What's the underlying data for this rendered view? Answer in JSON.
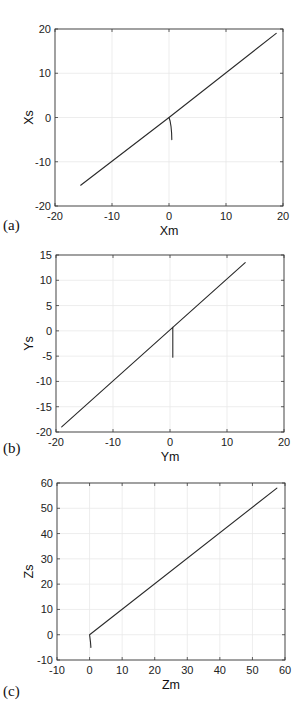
{
  "chart_data": [
    {
      "type": "line",
      "panel": "(a)",
      "title": "",
      "xlabel": "Xm",
      "ylabel": "Xs",
      "xlim": [
        -20,
        20
      ],
      "ylim": [
        -20,
        20
      ],
      "xticks": [
        -20,
        -10,
        0,
        10,
        20
      ],
      "yticks": [
        -20,
        -10,
        0,
        10,
        20
      ],
      "grid": true,
      "frame": {
        "left": 55,
        "top": 29,
        "right": 283,
        "bottom": 206
      },
      "series": [
        {
          "name": "trajectory",
          "x": [
            0.5,
            0.45,
            0.35,
            0.2,
            0.0,
            -15.5
          ],
          "y": [
            -5.0,
            -3.5,
            -2.0,
            -0.8,
            0.0,
            -15.3
          ]
        },
        {
          "name": "trajectory-main",
          "x": [
            0.0,
            18.8
          ],
          "y": [
            0.0,
            19.0
          ]
        }
      ]
    },
    {
      "type": "line",
      "panel": "(b)",
      "title": "",
      "xlabel": "Ym",
      "ylabel": "Ys",
      "xlim": [
        -20,
        20
      ],
      "ylim": [
        -20,
        15
      ],
      "xticks": [
        -20,
        -10,
        0,
        10,
        20
      ],
      "yticks": [
        -20,
        -15,
        -10,
        -5,
        0,
        5,
        10,
        15
      ],
      "grid": true,
      "frame": {
        "left": 56,
        "top": 255,
        "right": 284,
        "bottom": 432
      },
      "series": [
        {
          "name": "trajectory",
          "x": [
            0.5,
            0.5,
            0.5,
            -19.0
          ],
          "y": [
            -5.2,
            -2.0,
            0.7,
            -19.0
          ]
        },
        {
          "name": "trajectory-main",
          "x": [
            0.5,
            13.2
          ],
          "y": [
            0.7,
            13.5
          ]
        }
      ]
    },
    {
      "type": "line",
      "panel": "(c)",
      "title": "",
      "xlabel": "Zm",
      "ylabel": "Zs",
      "xlim": [
        -10,
        60
      ],
      "ylim": [
        -10,
        60
      ],
      "xticks": [
        -10,
        0,
        10,
        20,
        30,
        40,
        50,
        60
      ],
      "yticks": [
        -10,
        0,
        10,
        20,
        30,
        40,
        50,
        60
      ],
      "grid": true,
      "frame": {
        "left": 57,
        "top": 483,
        "right": 285,
        "bottom": 660
      },
      "series": [
        {
          "name": "trajectory",
          "x": [
            0.4,
            0.3,
            0.1,
            0.0,
            57.5
          ],
          "y": [
            -5.0,
            -3.0,
            -1.0,
            0.0,
            58.0
          ]
        }
      ]
    }
  ],
  "panels": {
    "a": {
      "label": "(a)",
      "xlabel": "Xm",
      "ylabel": "Xs",
      "xticks": [
        "-20",
        "-10",
        "0",
        "10",
        "20"
      ],
      "yticks": [
        "-20",
        "-10",
        "0",
        "10",
        "20"
      ]
    },
    "b": {
      "label": "(b)",
      "xlabel": "Ym",
      "ylabel": "Ys",
      "xticks": [
        "-20",
        "-10",
        "0",
        "10",
        "20"
      ],
      "yticks": [
        "-20",
        "-15",
        "-10",
        "-5",
        "0",
        "5",
        "10",
        "15"
      ]
    },
    "c": {
      "label": "(c)",
      "xlabel": "Zm",
      "ylabel": "Zs",
      "xticks": [
        "-10",
        "0",
        "10",
        "20",
        "30",
        "40",
        "50",
        "60"
      ],
      "yticks": [
        "-10",
        "0",
        "10",
        "20",
        "30",
        "40",
        "50",
        "60"
      ]
    }
  },
  "colors": {
    "line": "#2a2a2a",
    "frame": "#3a3a3a",
    "grid": "#e9e9e9",
    "background": "#ffffff"
  }
}
